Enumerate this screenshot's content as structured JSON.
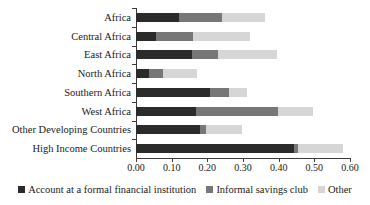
{
  "chart_data": {
    "type": "bar",
    "orientation": "horizontal",
    "stacked": true,
    "title": "",
    "subtitle": "",
    "xlabel": "",
    "ylabel": "",
    "xlim": [
      0.0,
      0.6
    ],
    "ylim": null,
    "grid": false,
    "legend_position": "bottom-center",
    "xticks": [
      "0.00",
      "0.10",
      "0.20",
      "0.30",
      "0.40",
      "0.50",
      "0.60"
    ],
    "xtick_values": [
      0.0,
      0.1,
      0.2,
      0.3,
      0.4,
      0.5,
      0.6
    ],
    "categories": [
      "Africa",
      "Central Africa",
      "East Africa",
      "North Africa",
      "Southern Africa",
      "West Africa",
      "Other Developing Countries",
      "High Income Countries"
    ],
    "series": [
      {
        "name": "Account at a formal financial institution",
        "color": "#2b2b2b",
        "values": [
          0.12,
          0.056,
          0.157,
          0.037,
          0.207,
          0.168,
          0.18,
          0.443
        ]
      },
      {
        "name": "Informal savings club",
        "color": "#777777",
        "values": [
          0.121,
          0.104,
          0.073,
          0.039,
          0.053,
          0.23,
          0.016,
          0.011
        ]
      },
      {
        "name": "Other",
        "color": "#d6d6d6",
        "values": [
          0.12,
          0.16,
          0.165,
          0.094,
          0.05,
          0.098,
          0.101,
          0.126
        ]
      }
    ],
    "totals": [
      0.361,
      0.32,
      0.395,
      0.17,
      0.31,
      0.496,
      0.297,
      0.58
    ],
    "annotations": []
  },
  "legend": {
    "items": [
      {
        "label": "Account at a formal financial institution",
        "color": "#2b2b2b"
      },
      {
        "label": "Informal savings club",
        "color": "#777777"
      },
      {
        "label": "Other",
        "color": "#d6d6d6"
      }
    ]
  }
}
